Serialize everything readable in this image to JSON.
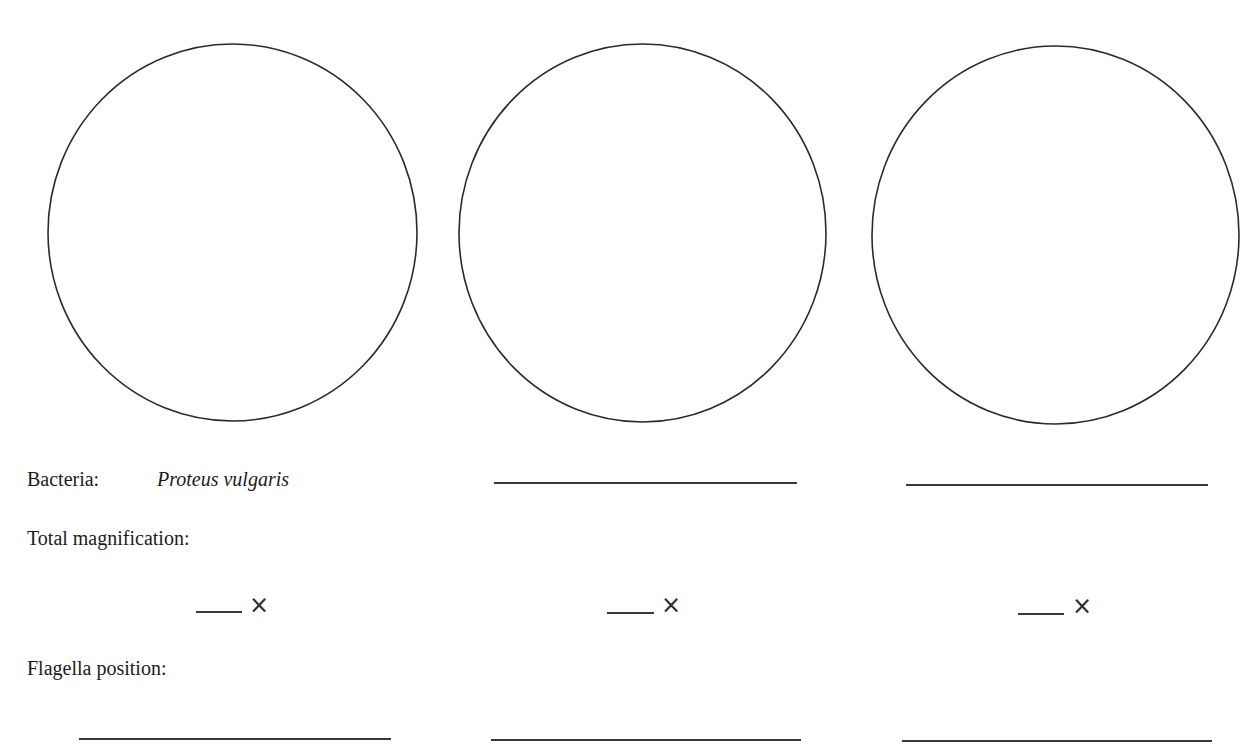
{
  "worksheet": {
    "fields": {
      "bacteria_label": "Bacteria:",
      "magnification_label": "Total magnification:",
      "flagella_label": "Flagella position:"
    },
    "columns": [
      {
        "bacteria_name": "Proteus vulgaris",
        "magnification_suffix": "×",
        "drawing_circle": "empty"
      },
      {
        "bacteria_name": "",
        "magnification_suffix": "×",
        "drawing_circle": "empty"
      },
      {
        "bacteria_name": "",
        "magnification_suffix": "×",
        "drawing_circle": "empty"
      }
    ]
  }
}
